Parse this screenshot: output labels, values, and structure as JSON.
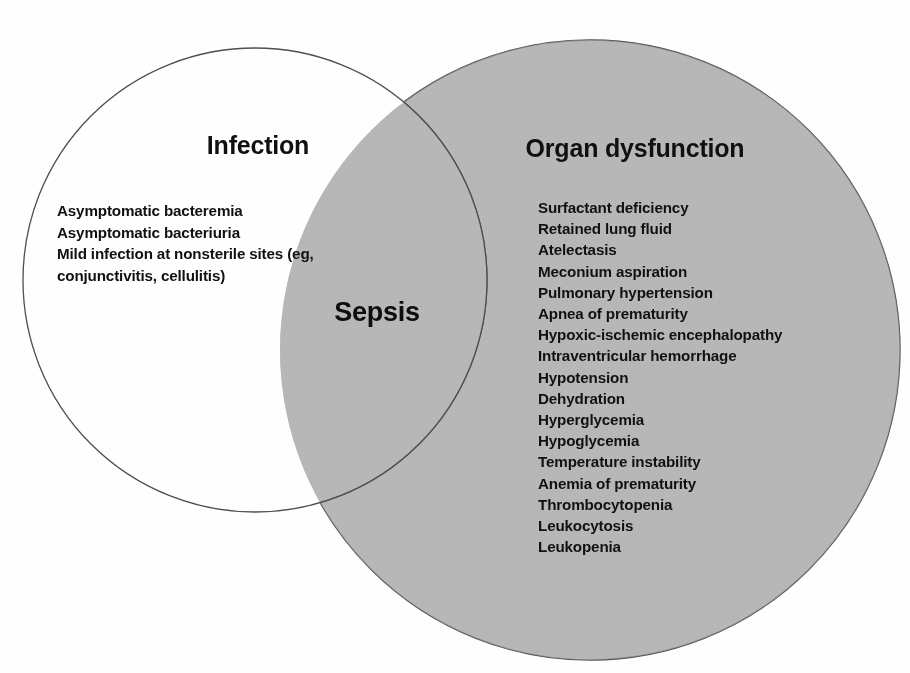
{
  "figure": {
    "type": "venn-diagram",
    "set_count": 2,
    "background_color": "#ffffff"
  },
  "sets": {
    "left": {
      "name": "infection",
      "title": "Infection",
      "fill_color": "#ffffff",
      "stroke_color": "#555555",
      "center_x": 255,
      "center_y": 280,
      "radius": 232,
      "items": [
        "Asymptomatic bacteremia",
        "Asymptomatic bacteriuria",
        "Mild infection at nonsterile sites (eg, conjunctivitis, cellulitis)"
      ]
    },
    "right": {
      "name": "organ-dysfunction",
      "title": "Organ dysfunction",
      "fill_color": "#b8b8b8",
      "stroke_color": "#555555",
      "center_x": 590,
      "center_y": 350,
      "radius": 310,
      "items": [
        "Surfactant deficiency",
        "Retained lung fluid",
        "Atelectasis",
        "Meconium aspiration",
        "Pulmonary hypertension",
        "Apnea of prematurity",
        "Hypoxic-ischemic encephalopathy",
        "Intraventricular hemorrhage",
        "Hypotension",
        "Dehydration",
        "Hyperglycemia",
        "Hypoglycemia",
        "Temperature instability",
        "Anemia of prematurity",
        "Thrombocytopenia",
        "Leukocytosis",
        "Leukopenia"
      ]
    }
  },
  "intersection": {
    "name": "sepsis",
    "label": "Sepsis",
    "text_color": "#0d0d0d"
  }
}
